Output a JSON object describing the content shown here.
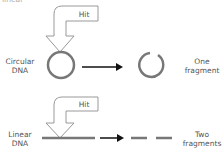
{
  "top_cutoff_text": "linear",
  "rows": [
    {
      "label_line1": "Circular",
      "label_line2": "DNA",
      "hit_label": "Hit",
      "result_line1": "One",
      "result_line2": "fragment"
    },
    {
      "label_line1": "Linear",
      "label_line2": "DNA",
      "hit_label": "Hit",
      "result_line1": "Two",
      "result_line2": "fragments"
    }
  ],
  "colors": {
    "dna_stroke": "#777777",
    "arrow_outline": "#999999",
    "process_arrow": "#111111"
  }
}
